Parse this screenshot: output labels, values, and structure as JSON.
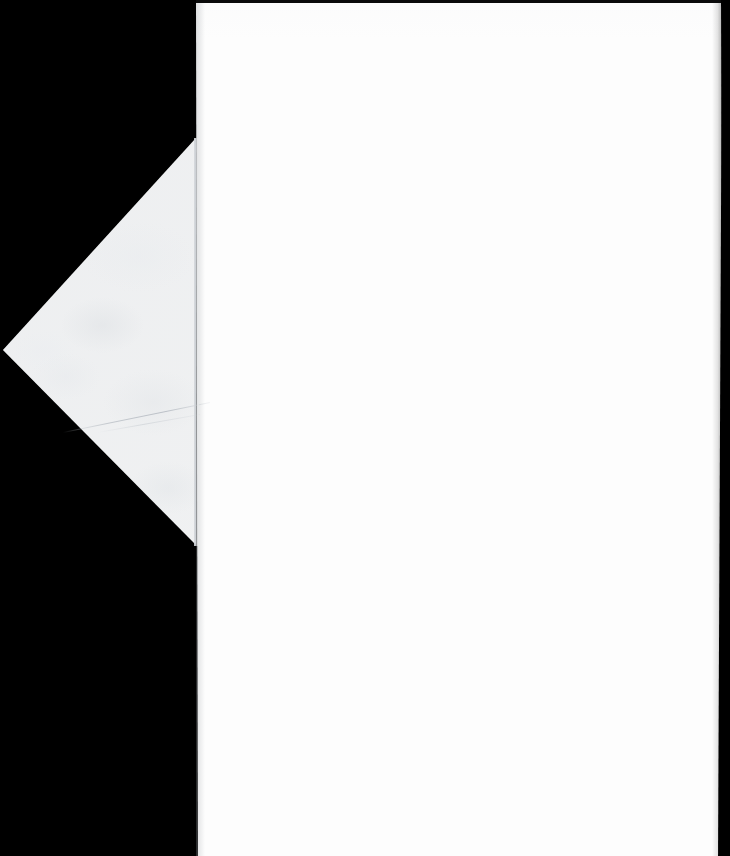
{
  "scan": {
    "width": 730,
    "height": 856,
    "background_color": "#000000",
    "subject": "envelope-back",
    "alt_text": ""
  },
  "colors": {
    "backdrop": "#000000",
    "paper_body": "#fdfdfd",
    "paper_flap": "#eff0f1",
    "crease_line": "#bec3c9",
    "seam_line": "#c8ccd1",
    "edge_strip": "#0a0a0a"
  },
  "regions": {
    "backdrop": {
      "name": "black-backdrop",
      "label": ""
    },
    "body": {
      "name": "envelope-body",
      "label": "",
      "left_px": 196,
      "right_px": 722,
      "top_px": 3,
      "bottom_px": 856
    },
    "flap": {
      "name": "envelope-point-flap",
      "label": "",
      "apex_x_px": 3,
      "apex_y_px": 350,
      "top_vertex_x_px": 196,
      "top_vertex_y_px": 138,
      "bottom_vertex_x_px": 196,
      "bottom_vertex_y_px": 545
    },
    "crease": {
      "name": "flap-crease-line",
      "label": ""
    },
    "seam": {
      "name": "flap-body-seam",
      "label": ""
    },
    "edge_top": {
      "name": "top-edge-strip",
      "label": ""
    },
    "edge_right": {
      "name": "right-edge-strip",
      "label": ""
    }
  },
  "text_content": {
    "visible_text": "",
    "note": ""
  }
}
